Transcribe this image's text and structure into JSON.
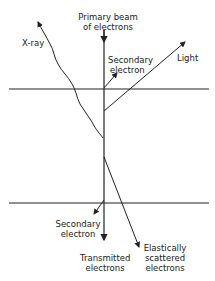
{
  "labels": {
    "primary_beam": [
      "Primary beam",
      "of electrons"
    ],
    "xray": "X-ray",
    "secondary_top": [
      "Secondary",
      "electron"
    ],
    "light": "Light",
    "secondary_bottom": [
      "Secondary",
      "electron"
    ],
    "transmitted": [
      "Transmitted",
      "electrons"
    ],
    "elastic": [
      "Elastically",
      "scattered",
      "electrons"
    ]
  },
  "colors": {
    "line": "#222222",
    "background": "#ffffff"
  }
}
